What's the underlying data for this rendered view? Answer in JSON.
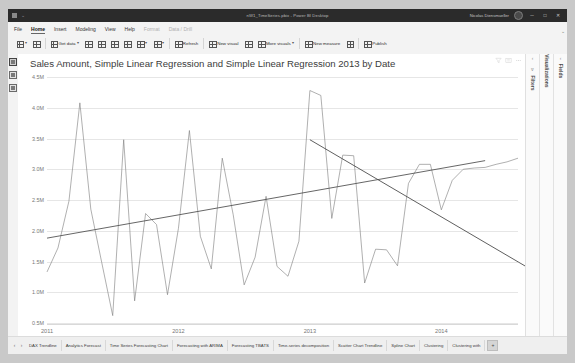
{
  "window": {
    "title": "nW1_TimeSeries.pbix - Power BI Desktop",
    "user": "Nicolas Diensmueller",
    "minimize": "─",
    "maximize": "□",
    "close": "✕",
    "quick_caret": "⌄",
    "titlebar_color": "#2b2b2b"
  },
  "ribbon": {
    "tabs": [
      {
        "label": "File",
        "state": "normal"
      },
      {
        "label": "Home",
        "state": "active"
      },
      {
        "label": "Insert",
        "state": "normal"
      },
      {
        "label": "Modeling",
        "state": "normal"
      },
      {
        "label": "View",
        "state": "normal"
      },
      {
        "label": "Help",
        "state": "normal"
      },
      {
        "label": "Format",
        "state": "dim"
      },
      {
        "label": "Data / Drill",
        "state": "dim"
      }
    ],
    "commands": [
      {
        "label": "",
        "icon": "paste-icon",
        "caret": true
      },
      {
        "label": "",
        "icon": "format-painter-icon",
        "caret": false
      },
      {
        "label": "Get data",
        "icon": "get-data-icon",
        "caret": true
      },
      {
        "label": "",
        "icon": "excel-icon",
        "caret": false
      },
      {
        "label": "",
        "icon": "powerbi-datasets-icon",
        "caret": false
      },
      {
        "label": "",
        "icon": "sql-server-icon",
        "caret": false
      },
      {
        "label": "",
        "icon": "enter-data-icon",
        "caret": false
      },
      {
        "label": "",
        "icon": "dataverse-icon",
        "caret": true
      },
      {
        "label": "",
        "icon": "transform-data-icon",
        "caret": true
      },
      {
        "label": "Refresh",
        "icon": "refresh-icon",
        "caret": false
      },
      {
        "label": "New visual",
        "icon": "new-visual-icon",
        "caret": false
      },
      {
        "label": "",
        "icon": "text-box-icon",
        "caret": false
      },
      {
        "label": "More visuals",
        "icon": "more-visuals-icon",
        "caret": true
      },
      {
        "label": "New measure",
        "icon": "new-measure-icon",
        "caret": false
      },
      {
        "label": "",
        "icon": "quick-measure-icon",
        "caret": false
      },
      {
        "label": "Publish",
        "icon": "publish-icon",
        "caret": false
      }
    ]
  },
  "left_rail": {
    "items": [
      {
        "name": "report-view",
        "selected": true
      },
      {
        "name": "data-view",
        "selected": false
      },
      {
        "name": "model-view",
        "selected": false
      }
    ]
  },
  "right_panes": [
    {
      "name": "filters",
      "label": "Filters",
      "caret": "‹",
      "filter_icon": "∇"
    },
    {
      "name": "visualizations",
      "label": "Visualizations",
      "caret": "‹",
      "filter_icon": ""
    },
    {
      "name": "fields",
      "label": "Fields",
      "caret": "‹",
      "filter_icon": ""
    }
  ],
  "visual_header": {
    "icons": [
      "filter-icon",
      "focus-mode-icon",
      "more-options-icon"
    ]
  },
  "page_tabs": {
    "prev": "‹",
    "next": "›",
    "add_label": "+",
    "items": [
      {
        "label": "DAX Trendline",
        "active": false
      },
      {
        "label": "Analytics Forecast",
        "active": false
      },
      {
        "label": "Time Series Forecasting Chart",
        "active": false
      },
      {
        "label": "Forecasting with ARIMA",
        "active": false
      },
      {
        "label": "Forecasting TBATS",
        "active": false
      },
      {
        "label": "Time-series decomposition",
        "active": false
      },
      {
        "label": "Scatter Chart Trendline",
        "active": false
      },
      {
        "label": "Spline Chart",
        "active": false
      },
      {
        "label": "Clustering",
        "active": false
      },
      {
        "label": "Clustering with ",
        "active": false
      }
    ]
  },
  "chart_data": {
    "type": "line",
    "title": "Sales Amount, Simple Linear Regression and Simple Linear Regression 2013 by Date",
    "xlabel": "",
    "ylabel": "",
    "grid": true,
    "legend_position": "none",
    "ylim": [
      500000,
      4500000
    ],
    "ytick_labels": [
      "4.5M",
      "4.0M",
      "3.5M",
      "3.0M",
      "2.5M",
      "2.0M",
      "1.5M",
      "1.0M",
      "0.5M"
    ],
    "ytick_values": [
      4500000,
      4000000,
      3500000,
      3000000,
      2500000,
      2000000,
      1500000,
      1000000,
      500000
    ],
    "xtick_labels": [
      "2011",
      "2012",
      "2013",
      "2014"
    ],
    "xtick_positions": [
      0,
      12,
      24,
      36
    ],
    "x_count": 44,
    "series": [
      {
        "name": "Sales Amount",
        "color": "#7a7a7a",
        "values": [
          1330000,
          1720000,
          2480000,
          4080000,
          2350000,
          1480000,
          620000,
          3480000,
          860000,
          2280000,
          2100000,
          960000,
          2040000,
          3630000,
          1910000,
          1380000,
          3180000,
          2260000,
          1120000,
          1570000,
          2560000,
          1420000,
          1260000,
          1830000,
          4280000,
          4200000,
          2200000,
          3230000,
          3220000,
          1150000,
          1700000,
          1690000,
          1430000,
          2770000,
          3080000,
          3080000,
          2340000,
          2820000,
          3000000,
          3020000,
          3030000,
          3080000,
          3120000,
          3180000
        ]
      },
      {
        "name": "Simple Linear Regression",
        "color": "#555555",
        "type": "trend",
        "start": 1880000,
        "end": 3140000,
        "x_start": 0,
        "x_end": 40
      },
      {
        "name": "Simple Linear Regression 2013",
        "color": "#4d4d4d",
        "type": "trend",
        "start": 3480000,
        "end": 1390000,
        "x_start": 24,
        "x_end": 44
      }
    ]
  }
}
